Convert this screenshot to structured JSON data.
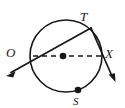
{
  "figure": {
    "kind": "circle-geometry-diagram",
    "background_color": "#ffffff",
    "stroke_color": "#161616",
    "labels": [
      {
        "id": "T",
        "text": "T",
        "x": 91,
        "y": 28,
        "anchor": "above-right"
      },
      {
        "id": "O",
        "text": "O",
        "x": 33,
        "y": 56,
        "anchor": "above-left"
      },
      {
        "id": "X",
        "text": "X",
        "x": 101,
        "y": 56,
        "anchor": "right"
      },
      {
        "id": "S",
        "text": "S",
        "x": 78,
        "y": 91,
        "anchor": "below"
      }
    ],
    "circle": {
      "cx": 66,
      "cy": 56,
      "r": 36,
      "stroke_width": 1.6
    },
    "center_dot": {
      "cx": 63,
      "cy": 56,
      "r": 3.2
    },
    "point_dots": [
      {
        "id": "S",
        "cx": 78,
        "cy": 90,
        "r": 3.2
      }
    ],
    "dashed_diameter": {
      "from": {
        "x": 33,
        "y": 56
      },
      "to": {
        "x": 101,
        "y": 56
      },
      "dash_pattern": "5,4",
      "stroke_width": 1.6
    },
    "rays": [
      {
        "id": "ray-T-O",
        "from": {
          "x": 91,
          "y": 28
        },
        "through": {
          "x": 33,
          "y": 56
        },
        "to": {
          "x": 7,
          "y": 76
        },
        "arrow_at": "to",
        "stroke_width": 1.7
      },
      {
        "id": "ray-T-X",
        "from": {
          "x": 91,
          "y": 28
        },
        "through": {
          "x": 101,
          "y": 56
        },
        "to": {
          "x": 115,
          "y": 81
        },
        "arrow_at": "to",
        "stroke_width": 1.7
      }
    ]
  }
}
